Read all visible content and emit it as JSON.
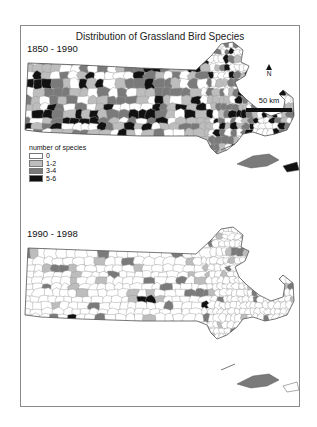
{
  "figure": {
    "title": "Distribution of Grassland Bird Species",
    "north_label": "N",
    "scale_label": "50 km"
  },
  "legend": {
    "title": "number of species",
    "items": [
      {
        "label": "0",
        "color": "#ffffff"
      },
      {
        "label": "1-2",
        "color": "#bdbdbd"
      },
      {
        "label": "3-4",
        "color": "#7a7a7a"
      },
      {
        "label": "5-6",
        "color": "#111111"
      }
    ]
  },
  "panels": [
    {
      "period": "1850 - 1990",
      "distribution": {
        "0": 0.3,
        "1-2": 0.3,
        "3-4": 0.22,
        "5-6": 0.18
      }
    },
    {
      "period": "1990 - 1998",
      "distribution": {
        "0": 0.8,
        "1-2": 0.12,
        "3-4": 0.06,
        "5-6": 0.02
      }
    }
  ],
  "chart_data": {
    "type": "choropleth",
    "title": "Distribution of Grassland Bird Species",
    "region": "Massachusetts towns",
    "legend_title": "number of species",
    "categories": [
      "0",
      "1-2",
      "3-4",
      "5-6"
    ],
    "category_colors": [
      "#ffffff",
      "#bdbdbd",
      "#7a7a7a",
      "#111111"
    ],
    "panels": [
      {
        "label": "1850 - 1990",
        "dominant_pattern": "widespread gray and black towns across the state; many 5-6 towns in central and eastern MA"
      },
      {
        "label": "1990 - 1998",
        "dominant_pattern": "mostly 0 (white); few scattered 1-2 and 3-4 towns; a handful of 5-6 towns in central MA and southeast"
      }
    ],
    "annotations": [
      "N (north arrow)",
      "50 km scale bar"
    ]
  }
}
